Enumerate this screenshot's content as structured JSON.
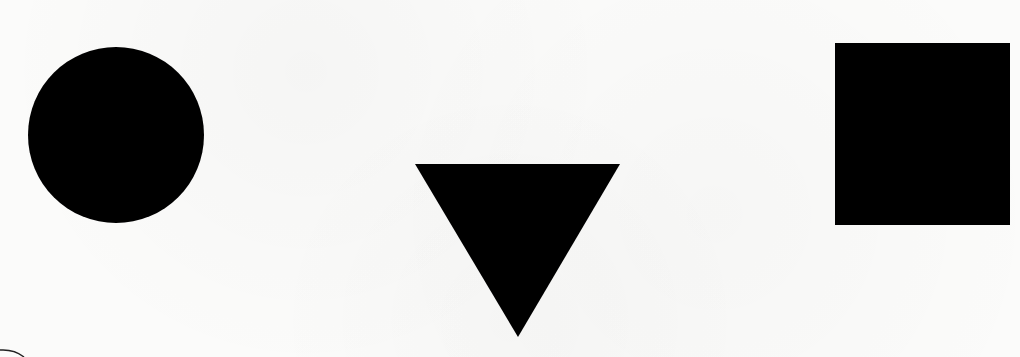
{
  "scene": {
    "background": "#fbfbfa",
    "fill": "#000000",
    "shapes": [
      {
        "name": "circle",
        "cx": 116,
        "cy": 135,
        "r": 88
      },
      {
        "name": "triangle-down",
        "points": "415,164 620,164 518,337"
      },
      {
        "name": "square",
        "x": 835,
        "y": 43,
        "width": 175,
        "height": 182
      }
    ],
    "corner_arc": {
      "cx": 0,
      "cy": 372,
      "r": 22
    }
  }
}
